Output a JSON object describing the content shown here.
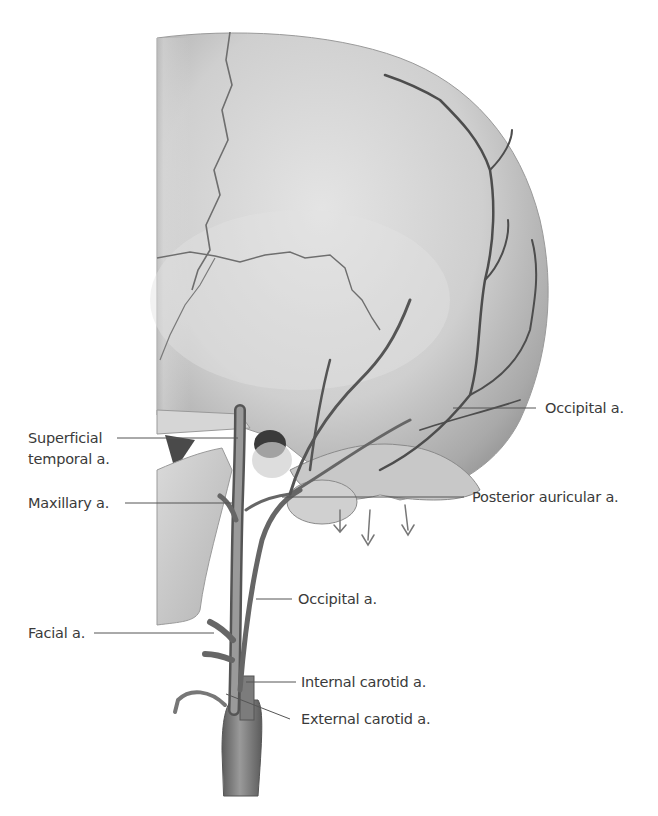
{
  "figure": {
    "colors": {
      "background": "#ffffff",
      "bone_light": "#d9d9d9",
      "bone_mid": "#bdbdbd",
      "bone_dark": "#8e8e8e",
      "vessel": "#7a7a7a",
      "vessel_dark": "#4d4d4d",
      "label_text": "#3a3a3a",
      "leader_line": "#555555"
    }
  },
  "labels": {
    "superficial_temporal": {
      "line1": "Superficial",
      "line2": "temporal a."
    },
    "maxillary": "Maxillary a.",
    "facial": "Facial a.",
    "occipital_upper": "Occipital a.",
    "posterior_auricular": "Posterior auricular a.",
    "occipital_lower": "Occipital a.",
    "internal_carotid": "Internal carotid a.",
    "external_carotid": "External carotid a."
  }
}
